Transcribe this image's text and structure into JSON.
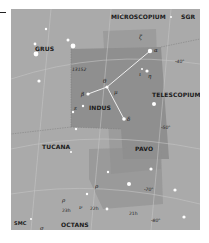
{
  "colors": {
    "background": "#aaaaaa",
    "indus_region": "#8f8f8f",
    "shaded_region": "#9c9c9c",
    "lines": "#eeeeee",
    "stars": "#ffffff"
  },
  "constellations": {
    "microscopium": "MICROSCOPIUM",
    "sgr": "SGR",
    "grus": "GRUS",
    "indus": "INDUS",
    "telescopium": "TELESCOPIUM",
    "tucana": "TUCANA",
    "pavo": "PAVO",
    "octans": "OCTANS",
    "smc": "SMC"
  },
  "object_labels": {
    "ngc": "13152"
  },
  "greek": {
    "alpha": "α",
    "beta": "β",
    "delta": "δ",
    "epsilon": "ε",
    "theta": "θ",
    "mu": "μ",
    "eta": "η",
    "iota": "ι",
    "zeta": "ζ",
    "rho": "ρ",
    "nu": "ν",
    "sigma": "σ"
  },
  "dec_labels": {
    "m40": "-40°",
    "m50": "-50°",
    "m70": "-70°",
    "m80": "-80°"
  },
  "ra_labels": {
    "h23": "23h",
    "h22": "22h",
    "h21": "21h"
  }
}
